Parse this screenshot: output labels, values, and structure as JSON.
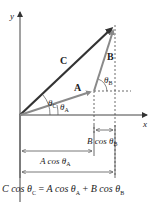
{
  "diagram": {
    "axes": {
      "x_label": "x",
      "y_label": "y"
    },
    "vectors": {
      "A": {
        "label": "A",
        "color": "#8a8a8a",
        "tail": [
          20,
          115
        ],
        "tip": [
          94,
          91
        ]
      },
      "B": {
        "label": "B",
        "color": "#8a8a8a",
        "tail": [
          94,
          91
        ],
        "tip": [
          115,
          25
        ]
      },
      "C": {
        "label": "C",
        "color": "#333333",
        "tail": [
          20,
          115
        ],
        "tip": [
          115,
          25
        ]
      }
    },
    "angles": {
      "theta_A": {
        "sym": "θ",
        "sub": "A"
      },
      "theta_B": {
        "sym": "θ",
        "sub": "B"
      },
      "theta_C": {
        "sym": "θ",
        "sub": "C"
      }
    },
    "projections": {
      "B_cos": {
        "prefix": "B cos ",
        "sym": "θ",
        "sub": "B"
      },
      "A_cos": {
        "prefix": "A cos ",
        "sym": "θ",
        "sub": "A"
      }
    },
    "equation": {
      "lhs_prefix": "C cos ",
      "lhs_sub": "C",
      "eq": " = ",
      "t1_prefix": "A cos ",
      "t1_sub": "A",
      "plus": " + ",
      "t2_prefix": "B cos ",
      "t2_sub": "B",
      "sym": "θ"
    }
  }
}
